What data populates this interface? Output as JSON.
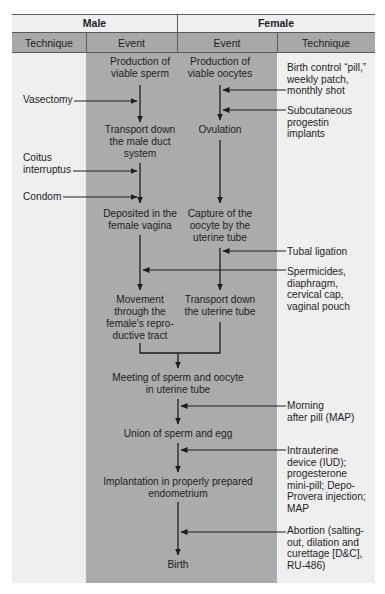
{
  "header": {
    "male": "Male",
    "female": "Female",
    "columns": [
      "Technique",
      "Event",
      "Event",
      "Technique"
    ]
  },
  "male": {
    "events": [
      "Production of\nviable sperm",
      "Transport down\nthe  male duct\nsystem",
      "Deposited in the\nfemale vagina",
      "Movement\nthrough the\nfemale's repro-\nductive tract"
    ],
    "techniques": [
      "Vasectomy",
      "Coitus\ninterruptus",
      "Condom"
    ]
  },
  "female": {
    "events": [
      "Production of\nviable oocytes",
      "Ovulation",
      "Capture of the\noocyte by the\nuterine tube",
      "Transport down\nthe uterine tube"
    ],
    "techniques": [
      "Birth control “pill,”\nweekly patch,\nmonthly shot",
      "Subcutaneous\nprogestin\nimplants",
      "Tubal ligation",
      "Spermicides,\ndiaphragm,\ncervical cap,\nvaginal pouch",
      "Morning\nafter pill (MAP)",
      "Intrauterine\ndevice (IUD);\nprogesterone\nmini-pill; Depo-\nProvera injection;\nMAP",
      "Abortion (salting-\nout, dilation and\ncurettage [D&C],\nRU-486)"
    ]
  },
  "shared_events": [
    "Meeting of sperm and oocyte\nin uterine tube",
    "Union of sperm and egg",
    "Implantation in properly prepared\nendometrium",
    "Birth"
  ],
  "colors": {
    "panel": "#efefef",
    "header_band": "#a8a8a8",
    "event_column": "#ababab",
    "lines": "#1e1e1e"
  }
}
